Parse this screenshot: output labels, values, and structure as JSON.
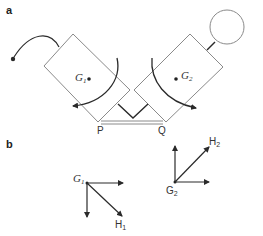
{
  "panels": {
    "a": {
      "label": "a",
      "points": {
        "G1": {
          "main": "G",
          "sub": "1"
        },
        "G2": {
          "main": "G",
          "sub": "2"
        },
        "P": "P",
        "Q": "Q"
      }
    },
    "b": {
      "label": "b",
      "points": {
        "G1": {
          "main": "G",
          "sub": "1"
        },
        "G2": {
          "main": "G",
          "sub": "2"
        },
        "H1": {
          "main": "H",
          "sub": "1"
        },
        "H2": {
          "main": "H",
          "sub": "2"
        }
      }
    }
  },
  "colors": {
    "outline": "#8a8a8a",
    "arrow": "#2a2a2a",
    "text": "#333333"
  }
}
